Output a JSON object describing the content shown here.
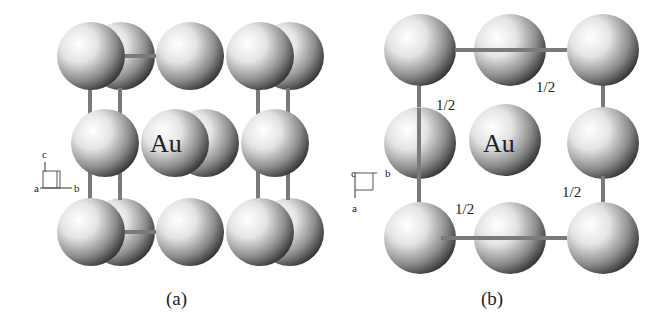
{
  "figure": {
    "element_label": "Au",
    "panels": [
      {
        "id": "a",
        "caption": "(a)",
        "center_label": "Au",
        "axes": {
          "up": "c",
          "right": "b",
          "out": "a"
        }
      },
      {
        "id": "b",
        "caption": "(b)",
        "center_label": "Au",
        "axes": {
          "down": "a",
          "right": "b",
          "out": "c"
        },
        "fraction_labels": [
          "1/2",
          "1/2",
          "1/2",
          "1/2"
        ]
      }
    ]
  },
  "colors": {
    "background": "#ffffff",
    "bond": "#7a7a7a",
    "sphere_highlight": "#ffffff",
    "sphere_shadow": "#2a2a2a",
    "text": "#222222"
  }
}
